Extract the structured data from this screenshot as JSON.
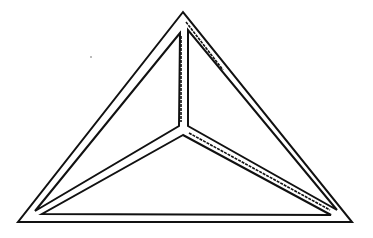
{
  "figure": {
    "stroke_color": "#111111",
    "background_color": "#ffffff",
    "outer_triangle": [
      [
        183,
        12
      ],
      [
        18,
        222
      ],
      [
        352,
        222
      ]
    ],
    "faces": [
      {
        "name": "left-face",
        "points": [
          [
            180,
            33
          ],
          [
            35,
            211
          ],
          [
            179,
            126
          ]
        ]
      },
      {
        "name": "right-face",
        "points": [
          [
            188,
            30
          ],
          [
            188,
            126
          ],
          [
            337,
            210
          ]
        ]
      },
      {
        "name": "bottom-face",
        "points": [
          [
            183,
            135
          ],
          [
            42,
            214
          ],
          [
            331,
            215
          ]
        ]
      }
    ],
    "apex": [
      183,
      12
    ],
    "center_junction": [
      184,
      129
    ],
    "shading_strokes": [
      {
        "from": [
          181,
          36
        ],
        "to": [
          181,
          122
        ]
      },
      {
        "from": [
          189,
          133
        ],
        "to": [
          330,
          210
        ]
      },
      {
        "from": [
          186,
          22
        ],
        "to": [
          223,
          70
        ]
      }
    ]
  }
}
